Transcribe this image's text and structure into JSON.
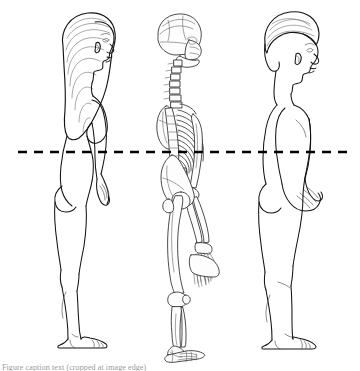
{
  "illustration": {
    "title": "Lateral (side) view comparison of female body, skeleton and male body",
    "view": "lateral profile, all figures facing right",
    "background_color": "#ffffff",
    "line_color": "#1a1a1a",
    "shade_color": "#8d8d8d",
    "reference_line": {
      "name": "horizontal reference line",
      "style": "dashed",
      "color": "#000000",
      "y_position_px": 152,
      "x_start_px": 18,
      "x_end_px": 348,
      "dash_pattern": "9 7",
      "thickness_px": 2.6
    },
    "panels": [
      {
        "id": "female-figure",
        "label": "Female body, lateral view",
        "order": 1,
        "hair": "long straight hair past shoulders",
        "x_center_px": 85,
        "top_px": 12,
        "bottom_px": 349
      },
      {
        "id": "skeleton-figure",
        "label": "Human skeleton, lateral view",
        "order": 2,
        "parts": [
          "skull",
          "cervical spine",
          "thoracic spine",
          "rib cage",
          "sternum",
          "scapula",
          "humerus",
          "radius",
          "ulna",
          "carpals and phalanges",
          "pelvis",
          "sacrum",
          "femur",
          "patella",
          "tibia",
          "fibula",
          "tarsals and metatarsals"
        ],
        "x_center_px": 183,
        "top_px": 14,
        "bottom_px": 352
      },
      {
        "id": "male-figure",
        "label": "Male body, lateral view",
        "order": 3,
        "hair": "short hair",
        "x_center_px": 290,
        "top_px": 10,
        "bottom_px": 349
      }
    ]
  },
  "caption": {
    "text": "Figure caption text (cropped at image edge)",
    "visible": "partial top edge of a line of text, illegible"
  }
}
